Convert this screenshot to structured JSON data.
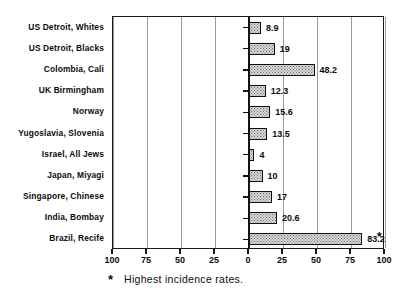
{
  "chart_data": {
    "type": "bar",
    "orientation": "horizontal",
    "title": "",
    "subtitle": "",
    "xlabel": "",
    "ylabel": "",
    "categories": [
      "US Detroit, Whites",
      "US Detroit, Blacks",
      "Colombia, Cali",
      "UK Birmingham",
      "Norway",
      "Yugoslavia, Slovenia",
      "Israel, All Jews",
      "Japan, Miyagi",
      "Singapore, Chinese",
      "India, Bombay",
      "Brazil, Recife"
    ],
    "values": [
      8.9,
      19,
      48.2,
      12.3,
      15.6,
      13.5,
      4,
      10,
      17,
      20.6,
      83.2
    ],
    "value_labels": [
      "8.9",
      "19",
      "48.2",
      "12.3",
      "15.6",
      "13.5",
      "4",
      "10",
      "17",
      "20.6",
      "83.2"
    ],
    "annotations": [
      {
        "category": "Brazil, Recife",
        "marker": "*",
        "meaning": "Highest incidence rates."
      }
    ],
    "xlim": [
      -100,
      100
    ],
    "xticks": [
      -100,
      -75,
      -50,
      -25,
      0,
      25,
      50,
      75,
      100
    ],
    "xticklabels": [
      "100",
      "75",
      "50",
      "25",
      "0",
      "25",
      "50",
      "75",
      "100"
    ],
    "grid": true,
    "grid_axis": "x",
    "legend": false,
    "bar_fill": "#d9d9d9",
    "bar_edge": "#101010"
  },
  "footnote": {
    "marker": "*",
    "text": "Highest incidence rates."
  }
}
